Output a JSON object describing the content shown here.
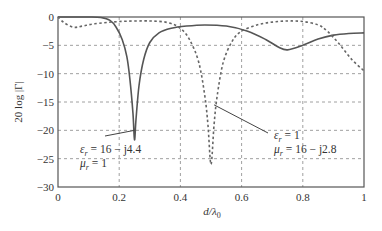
{
  "chart_data": {
    "type": "line",
    "title": "",
    "xlabel": "d/λ0",
    "ylabel": "20 log |Γ|",
    "xlim": [
      0,
      1
    ],
    "ylim": [
      -30,
      0
    ],
    "xticks": [
      0,
      0.2,
      0.4,
      0.6,
      0.8,
      1
    ],
    "xtick_labels": [
      "0",
      "0.2",
      "0.4",
      "0.6",
      "0.8",
      "1"
    ],
    "yticks": [
      0,
      -5,
      -10,
      -15,
      -20,
      -25,
      -30
    ],
    "ytick_labels": [
      "0",
      "−5",
      "−10",
      "−15",
      "−20",
      "−25",
      "−30"
    ],
    "grid": true,
    "series": [
      {
        "name": "εr = 16 − j4.4, μr = 1",
        "style": "solid",
        "x": [
          0,
          0.1,
          0.14,
          0.17,
          0.19,
          0.21,
          0.225,
          0.235,
          0.245,
          0.25,
          0.255,
          0.265,
          0.28,
          0.3,
          0.33,
          0.37,
          0.42,
          0.48,
          0.55,
          0.62,
          0.68,
          0.72,
          0.75,
          0.8,
          0.85,
          0.9,
          0.95,
          1.0
        ],
        "y": [
          0,
          0,
          -0.1,
          -0.6,
          -1.8,
          -4,
          -7,
          -11,
          -17,
          -21.7,
          -18,
          -12,
          -7.5,
          -4.5,
          -2.8,
          -2,
          -1.6,
          -1.4,
          -1.6,
          -2.5,
          -4,
          -5.3,
          -5.8,
          -5.0,
          -3.9,
          -3.2,
          -2.9,
          -2.8
        ]
      },
      {
        "name": "εr = 1, μr = 16 − j2.8",
        "style": "dashed",
        "x": [
          0,
          0.02,
          0.05,
          0.08,
          0.12,
          0.2,
          0.3,
          0.36,
          0.4,
          0.43,
          0.46,
          0.48,
          0.49,
          0.5,
          0.51,
          0.52,
          0.54,
          0.57,
          0.6,
          0.65,
          0.7,
          0.75,
          0.8,
          0.85,
          0.88,
          0.92,
          0.96,
          1.0
        ],
        "y": [
          0,
          -1,
          -1.8,
          -1.6,
          -1.2,
          -0.8,
          -0.7,
          -1.0,
          -2.0,
          -4,
          -8,
          -14,
          -19,
          -26,
          -19,
          -14,
          -8,
          -4.2,
          -2.5,
          -1.4,
          -0.9,
          -0.7,
          -0.8,
          -1.4,
          -2.5,
          -4.8,
          -7.5,
          -9.5
        ]
      }
    ],
    "annotations": [
      {
        "line1": "εr = 16 − j4.4",
        "line2": "μr = 1",
        "points_to": [
          0.25,
          -20
        ]
      },
      {
        "line1": "εr = 1",
        "line2": "μr = 16 − j2.8",
        "points_to": [
          0.51,
          -15.5
        ]
      }
    ]
  }
}
